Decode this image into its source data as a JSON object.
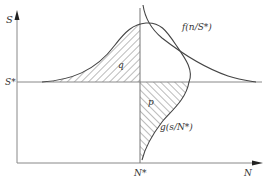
{
  "diagram": {
    "axes": {
      "y_label": "S",
      "x_label": "N",
      "y_marker_label": "S*",
      "x_marker_label": "N*"
    },
    "curves": {
      "f_label": "f(n/S*)",
      "g_label": "g(s/N*)"
    },
    "regions": {
      "q_label": "q",
      "p_label": "p"
    },
    "colors": {
      "line": "#444444",
      "axis": "#888888",
      "hatch": "#555555",
      "text": "#333333"
    }
  }
}
